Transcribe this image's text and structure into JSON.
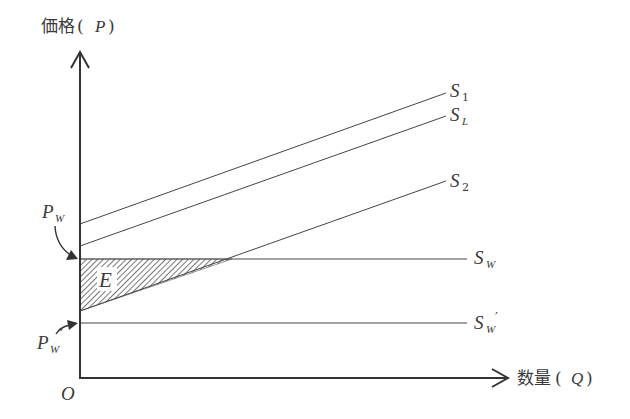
{
  "diagram": {
    "type": "supply-diagram",
    "y_axis": {
      "label_jp": "価格",
      "label_var": "P"
    },
    "x_axis": {
      "label_jp": "数量",
      "label_var": "Q"
    },
    "origin_label": "O",
    "price_labels": {
      "world_price": {
        "main": "P",
        "sub": "W"
      },
      "world_price_prime": {
        "main": "P",
        "sub": "W",
        "prime": "′"
      }
    },
    "curves": [
      {
        "id": "S1",
        "main": "S",
        "sub": "1"
      },
      {
        "id": "SL",
        "main": "S",
        "sub": "L"
      },
      {
        "id": "S2",
        "main": "S",
        "sub": "2"
      },
      {
        "id": "SW",
        "main": "S",
        "sub": "W"
      },
      {
        "id": "SWprime",
        "main": "S",
        "sub": "W",
        "prime": "′"
      }
    ],
    "shaded_region_label": "E"
  }
}
